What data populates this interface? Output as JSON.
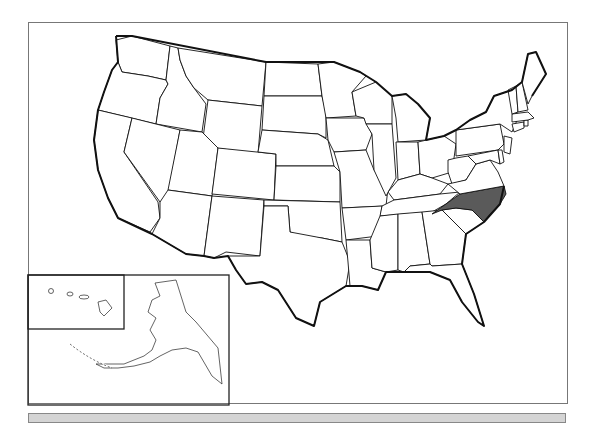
{
  "map": {
    "title": "United States",
    "highlighted_state": "North Carolina",
    "highlight_color": "#5a5a5a",
    "base_fill": "#ffffff",
    "border_color": "#111111",
    "insets": [
      "Alaska",
      "Hawaii"
    ],
    "states": [
      "Washington",
      "Oregon",
      "California",
      "Idaho",
      "Nevada",
      "Montana",
      "Wyoming",
      "Utah",
      "Arizona",
      "Colorado",
      "New Mexico",
      "North Dakota",
      "South Dakota",
      "Nebraska",
      "Kansas",
      "Oklahoma",
      "Texas",
      "Minnesota",
      "Iowa",
      "Missouri",
      "Arkansas",
      "Louisiana",
      "Wisconsin",
      "Illinois",
      "Michigan",
      "Indiana",
      "Ohio",
      "Kentucky",
      "Tennessee",
      "Mississippi",
      "Alabama",
      "Georgia",
      "Florida",
      "South Carolina",
      "North Carolina",
      "Virginia",
      "West Virginia",
      "Pennsylvania",
      "New York",
      "Maryland",
      "Delaware",
      "New Jersey",
      "Connecticut",
      "Rhode Island",
      "Massachusetts",
      "Vermont",
      "New Hampshire",
      "Maine",
      "Alaska",
      "Hawaii"
    ]
  },
  "footer_bar": {
    "color": "#d4d4d4"
  }
}
